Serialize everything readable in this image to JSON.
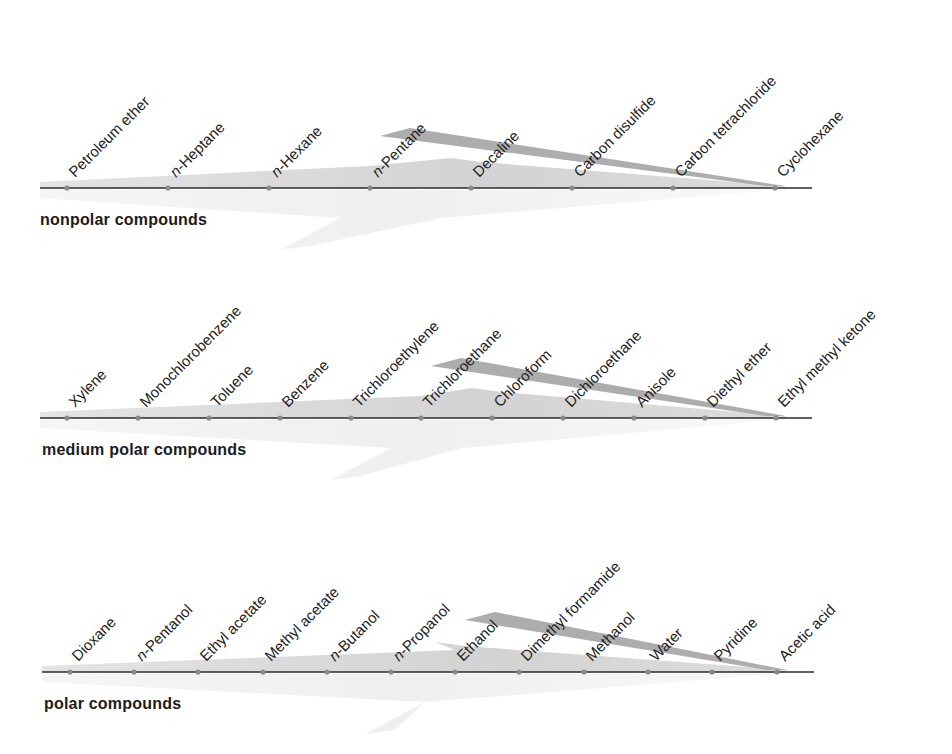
{
  "groups": [
    {
      "title": "nonpolar compounds",
      "axis_y": 188,
      "axis_x_start": 40,
      "axis_x_end": 812,
      "label_y": 220,
      "compounds": [
        {
          "name": "Petroleum ether",
          "x": 67
        },
        {
          "name": "n-Heptane",
          "x": 168,
          "italic_prefix": "n"
        },
        {
          "name": "n-Hexane",
          "x": 269,
          "italic_prefix": "n"
        },
        {
          "name": "n-Pentane",
          "x": 370,
          "italic_prefix": "n"
        },
        {
          "name": "Decaline",
          "x": 471
        },
        {
          "name": "Carbon disulfide",
          "x": 572
        },
        {
          "name": "Carbon tetrachloride",
          "x": 673
        },
        {
          "name": "Cyclohexane",
          "x": 775
        }
      ]
    },
    {
      "title": "medium polar compounds",
      "axis_y": 418,
      "axis_x_start": 40,
      "axis_x_end": 812,
      "label_y": 450,
      "compounds": [
        {
          "name": "Xylene",
          "x": 67
        },
        {
          "name": "Monochlorobenzene",
          "x": 138
        },
        {
          "name": "Toluene",
          "x": 209
        },
        {
          "name": "Benzene",
          "x": 280
        },
        {
          "name": "Trichloroethylene",
          "x": 351
        },
        {
          "name": "Trichloroethane",
          "x": 421
        },
        {
          "name": "Chloroform",
          "x": 492
        },
        {
          "name": "Dichloroethane",
          "x": 563
        },
        {
          "name": "Anisole",
          "x": 634
        },
        {
          "name": "Diethyl ether",
          "x": 705
        },
        {
          "name": "Ethyl methyl ketone",
          "x": 776
        }
      ]
    },
    {
      "title": "polar compounds",
      "axis_y": 672,
      "axis_x_start": 42,
      "axis_x_end": 814,
      "label_y": 704,
      "compounds": [
        {
          "name": "Dioxane",
          "x": 70
        },
        {
          "name": "n-Pentanol",
          "x": 134,
          "italic_prefix": "n"
        },
        {
          "name": "Ethyl acetate",
          "x": 198
        },
        {
          "name": "Methyl acetate",
          "x": 263
        },
        {
          "name": "n-Butanol",
          "x": 327,
          "italic_prefix": "n"
        },
        {
          "name": "n-Propanol",
          "x": 391,
          "italic_prefix": "n"
        },
        {
          "name": "Ethanol",
          "x": 455
        },
        {
          "name": "Dimethyl formamide",
          "x": 519
        },
        {
          "name": "Methanol",
          "x": 584
        },
        {
          "name": "Water",
          "x": 648
        },
        {
          "name": "Pyridine",
          "x": 712
        },
        {
          "name": "Acetic acid",
          "x": 777
        }
      ]
    }
  ],
  "colors": {
    "axis": "#2a2a2a",
    "dot": "#8a8a8a",
    "wedge_light": "#d6d6d6",
    "wedge_dark": "#a9a9a9",
    "shadow": "#ececec",
    "text": "#222222"
  }
}
